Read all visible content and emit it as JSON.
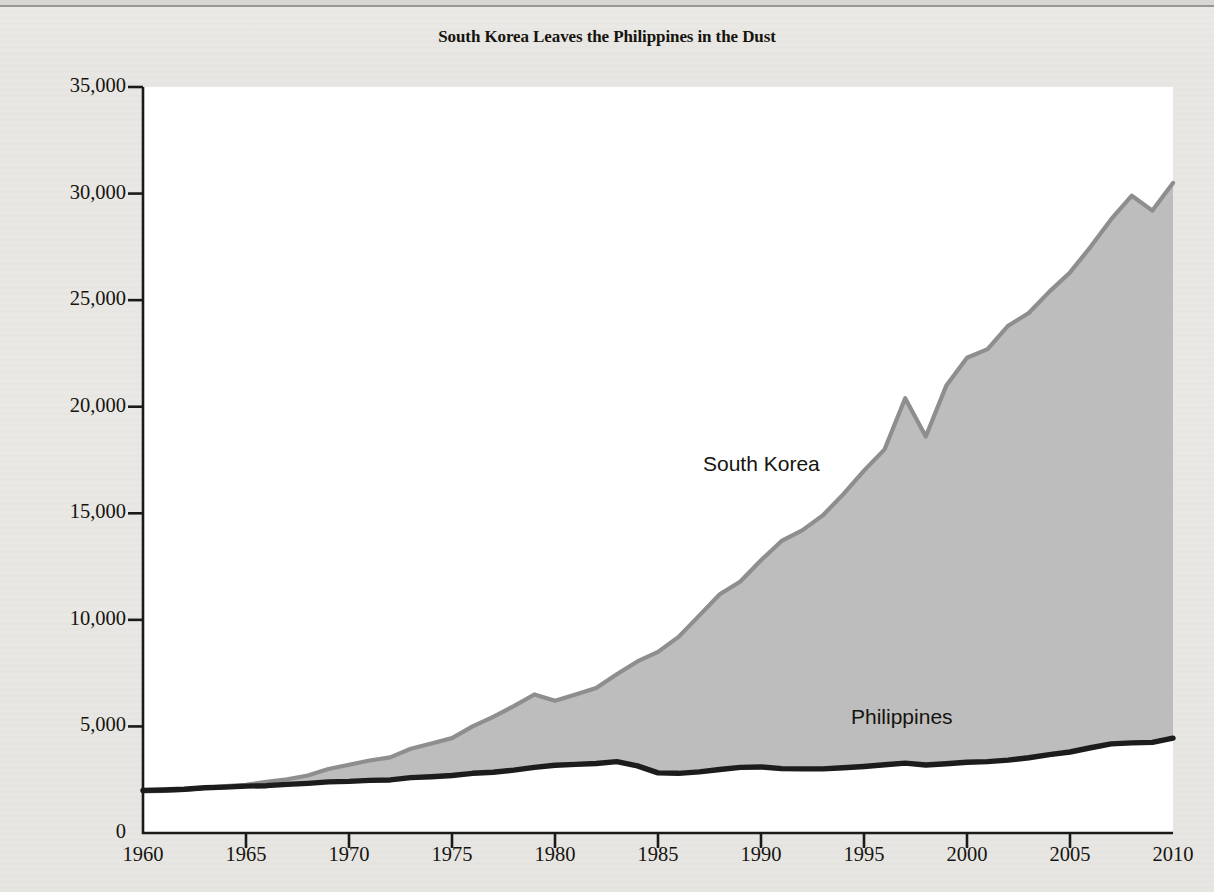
{
  "chart_data": {
    "type": "area",
    "title": "South Korea Leaves the Philippines in the Dust",
    "xlabel": "",
    "ylabel": "Real GDP per capita (2010 U.S. dollars)",
    "xlim": [
      1960,
      2010
    ],
    "ylim": [
      0,
      35000
    ],
    "grid": false,
    "legend_position": "inline-annotation",
    "y_ticks": [
      "0",
      "5,000",
      "10,000",
      "15,000",
      "20,000",
      "25,000",
      "30,000",
      "35,000"
    ],
    "y_tick_values": [
      0,
      5000,
      10000,
      15000,
      20000,
      25000,
      30000,
      35000
    ],
    "x_ticks": [
      "1960",
      "1965",
      "1970",
      "1975",
      "1980",
      "1985",
      "1990",
      "1995",
      "2000",
      "2005",
      "2010"
    ],
    "x_tick_values": [
      1960,
      1965,
      1970,
      1975,
      1980,
      1985,
      1990,
      1995,
      2000,
      2005,
      2010
    ],
    "x": [
      1960,
      1961,
      1962,
      1963,
      1964,
      1965,
      1966,
      1967,
      1968,
      1969,
      1970,
      1971,
      1972,
      1973,
      1974,
      1975,
      1976,
      1977,
      1978,
      1979,
      1980,
      1981,
      1982,
      1983,
      1984,
      1985,
      1986,
      1987,
      1988,
      1989,
      1990,
      1991,
      1992,
      1993,
      1994,
      1995,
      1996,
      1997,
      1998,
      1999,
      2000,
      2001,
      2002,
      2003,
      2004,
      2005,
      2006,
      2007,
      2008,
      2009,
      2010
    ],
    "series": [
      {
        "name": "South Korea",
        "color": "#8e8e8e",
        "fill": "#bdbdbd",
        "values": [
          1950,
          1980,
          2020,
          2120,
          2200,
          2260,
          2400,
          2520,
          2700,
          3000,
          3200,
          3400,
          3550,
          3950,
          4200,
          4450,
          5000,
          5450,
          5950,
          6500,
          6200,
          6500,
          6800,
          7450,
          8050,
          8500,
          9200,
          10200,
          11200,
          11800,
          12800,
          13700,
          14200,
          14900,
          15900,
          17000,
          18000,
          20400,
          18600,
          21000,
          22300,
          22700,
          23800,
          24400,
          25400,
          26300,
          27500,
          28800,
          29900,
          29200,
          30500
        ]
      },
      {
        "name": "Philippines",
        "color": "#1c1c1c",
        "fill": "#ffffff",
        "values": [
          2000,
          2020,
          2050,
          2120,
          2150,
          2200,
          2220,
          2280,
          2330,
          2400,
          2420,
          2470,
          2490,
          2600,
          2640,
          2700,
          2800,
          2850,
          2950,
          3080,
          3180,
          3220,
          3260,
          3350,
          3150,
          2820,
          2800,
          2870,
          2980,
          3080,
          3100,
          3020,
          3010,
          3010,
          3060,
          3120,
          3200,
          3280,
          3190,
          3250,
          3320,
          3350,
          3420,
          3530,
          3680,
          3800,
          4000,
          4180,
          4230,
          4250,
          4450
        ]
      }
    ],
    "annotations": [
      {
        "text": "South Korea",
        "x": 1994,
        "y": 17000
      },
      {
        "text": "Philippines",
        "x": 2001,
        "y": 5600
      }
    ]
  }
}
